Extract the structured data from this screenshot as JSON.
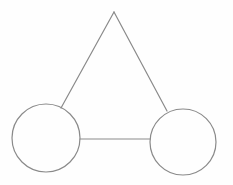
{
  "diagram": {
    "background": "#fefefe",
    "stroke_color": "#8a8a8a",
    "stroke_width": 1.2,
    "nodes": [
      {
        "id": "left-circle",
        "shape": "circle",
        "cx": 46,
        "cy": 138,
        "r": 34
      },
      {
        "id": "right-circle",
        "shape": "circle",
        "cx": 183,
        "cy": 142,
        "r": 33
      }
    ],
    "edges": [
      {
        "id": "left-side",
        "x1": 114,
        "y1": 12,
        "x2": 61,
        "y2": 108
      },
      {
        "id": "right-side",
        "x1": 114,
        "y1": 12,
        "x2": 167,
        "y2": 111
      },
      {
        "id": "base-connector",
        "x1": 80,
        "y1": 139,
        "x2": 150,
        "y2": 139
      }
    ],
    "apex": {
      "x": 114,
      "y": 12
    }
  }
}
